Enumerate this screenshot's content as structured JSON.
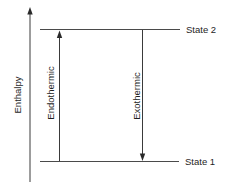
{
  "diagram": {
    "axis": {
      "label": "Enthalpy",
      "direction": "up"
    },
    "levels": [
      {
        "name": "state-2",
        "label": "State 2",
        "position": "high"
      },
      {
        "name": "state-1",
        "label": "State 1",
        "position": "low"
      }
    ],
    "transitions": [
      {
        "name": "endothermic",
        "label": "Endothermic",
        "from": "State 1",
        "to": "State 2",
        "direction": "up"
      },
      {
        "name": "exothermic",
        "label": "Exothermic",
        "from": "State 2",
        "to": "State 1",
        "direction": "down"
      }
    ],
    "colors": {
      "line": "#3a3a3a",
      "text": "#1e1e1e",
      "background": "#ffffff"
    }
  }
}
